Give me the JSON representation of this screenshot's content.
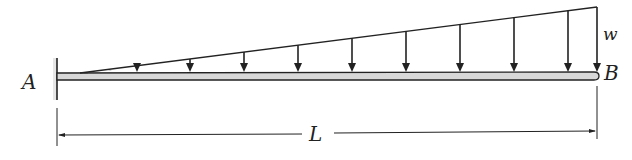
{
  "diagram": {
    "labels": {
      "fixed_end": "A",
      "free_end": "B",
      "load_intensity": "w",
      "length": "L"
    },
    "beam": {
      "x_start": 57,
      "x_end": 598,
      "y_top": 73,
      "y_bottom": 80
    },
    "wall": {
      "x": 57,
      "y_top": 58,
      "y_bottom": 100
    },
    "load": {
      "type": "triangular",
      "start": [
        80,
        73
      ],
      "end": [
        597,
        7
      ],
      "arrow_x": [
        137,
        190,
        244,
        298,
        352,
        406,
        460,
        514,
        568,
        597
      ]
    },
    "dimension": {
      "y": 135,
      "x_start": 57,
      "x_end": 597,
      "ext_top": 108,
      "ext_bottom": 146
    },
    "colors": {
      "line": "#222222",
      "beam_fill": "#d8d8d8"
    }
  }
}
